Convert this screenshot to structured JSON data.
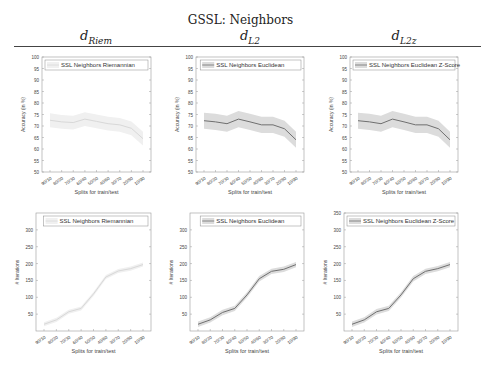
{
  "header": {
    "title": "GSSL: Neighbors",
    "columns": [
      {
        "main": "d",
        "sub": "Riem"
      },
      {
        "main": "d",
        "sub": "L2"
      },
      {
        "main": "d",
        "sub": "L2z"
      }
    ]
  },
  "colors": {
    "line_riem": "#d8d8d8",
    "band_riem": "#f0f0f0",
    "line_euc": "#707070",
    "band_euc": "#dcdcdc",
    "axis": "#9a9a9a",
    "text": "#444444"
  },
  "chart_data": [
    {
      "type": "line",
      "title": "",
      "legend": "SSL Neighbors Riemannian",
      "xlabel": "Splits for train/test",
      "ylabel": "Accuracy (in %)",
      "categories": [
        "90/10",
        "80/20",
        "70/30",
        "60/40",
        "50/50",
        "40/60",
        "30/70",
        "20/80",
        "10/90"
      ],
      "values": [
        72.5,
        71.8,
        71.5,
        73.0,
        72.0,
        71.0,
        70.5,
        69.0,
        64.5
      ],
      "band": 3,
      "ylim": [
        50,
        100
      ],
      "yticks": [
        50,
        55,
        60,
        65,
        70,
        75,
        80,
        85,
        90,
        95,
        100
      ]
    },
    {
      "type": "line",
      "title": "",
      "legend": "SSL Neighbors Euclidean",
      "xlabel": "Splits for train/test",
      "ylabel": "Accuracy (in %)",
      "categories": [
        "90/10",
        "80/20",
        "70/30",
        "60/40",
        "50/50",
        "40/60",
        "30/70",
        "20/80",
        "10/90"
      ],
      "values": [
        72.3,
        71.8,
        71.0,
        73.0,
        71.8,
        70.5,
        70.5,
        68.8,
        64.0
      ],
      "band": 3.5,
      "ylim": [
        50,
        100
      ],
      "yticks": [
        50,
        55,
        60,
        65,
        70,
        75,
        80,
        85,
        90,
        95,
        100
      ]
    },
    {
      "type": "line",
      "title": "",
      "legend": "SSL Neighbors Euclidean Z-Score",
      "xlabel": "Splits for train/test",
      "ylabel": "Accuracy (in %)",
      "categories": [
        "90/10",
        "80/20",
        "70/30",
        "60/40",
        "50/50",
        "40/60",
        "30/70",
        "20/80",
        "10/90"
      ],
      "values": [
        72.3,
        71.8,
        71.0,
        73.0,
        71.8,
        70.5,
        70.5,
        68.8,
        64.0
      ],
      "band": 3.5,
      "ylim": [
        50,
        100
      ],
      "yticks": [
        50,
        55,
        60,
        65,
        70,
        75,
        80,
        85,
        90,
        95,
        100
      ]
    },
    {
      "type": "line",
      "title": "",
      "legend": "SSL Neighbors Riemannian",
      "xlabel": "Splits for train/test",
      "ylabel": "# Iterations",
      "categories": [
        "90/10",
        "80/20",
        "70/30",
        "60/40",
        "50/50",
        "40/60",
        "30/70",
        "20/80",
        "10/90"
      ],
      "values": [
        20,
        33,
        57,
        67,
        110,
        160,
        178,
        185,
        197
      ],
      "band": 6,
      "ylim": [
        0,
        350
      ],
      "yticks": [
        50,
        100,
        150,
        200,
        250,
        300
      ]
    },
    {
      "type": "line",
      "title": "",
      "legend": "SSL Neighbors Euclidean",
      "xlabel": "Splits for train/test",
      "ylabel": "# Iterations",
      "categories": [
        "90/10",
        "80/20",
        "70/30",
        "60/40",
        "50/50",
        "40/60",
        "30/70",
        "20/80",
        "10/90"
      ],
      "values": [
        20,
        33,
        55,
        67,
        107,
        155,
        177,
        183,
        197
      ],
      "band": 8,
      "ylim": [
        0,
        350
      ],
      "yticks": [
        50,
        100,
        150,
        200,
        250,
        300
      ]
    },
    {
      "type": "line",
      "title": "",
      "legend": "SSL Neighbors Euclidean Z-Score",
      "xlabel": "Splits for train/test",
      "ylabel": "# Iterations",
      "categories": [
        "90/10",
        "80/20",
        "70/30",
        "60/40",
        "50/50",
        "40/60",
        "30/70",
        "20/80",
        "10/90"
      ],
      "values": [
        20,
        33,
        57,
        67,
        107,
        155,
        177,
        185,
        197
      ],
      "band": 8,
      "ylim": [
        0,
        350
      ],
      "yticks": [
        50,
        100,
        150,
        200,
        250,
        300,
        350
      ]
    }
  ]
}
